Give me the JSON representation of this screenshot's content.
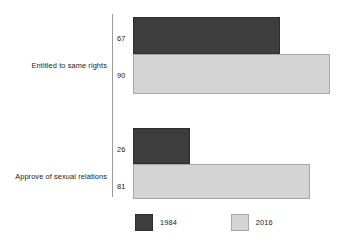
{
  "chart_data": {
    "type": "bar",
    "orientation": "horizontal",
    "title": "",
    "subtitle": "",
    "xlabel": "",
    "ylabel": "",
    "xlim": [
      0,
      100
    ],
    "grid": false,
    "legend_position": "bottom",
    "categories": [
      "Entitled to same rights",
      "Approve of sexual relations"
    ],
    "series": [
      {
        "name": "1984",
        "color": "#3d3d3d",
        "values": [
          67,
          26
        ]
      },
      {
        "name": "2016",
        "color": "#d4d4d4",
        "values": [
          90,
          81
        ]
      }
    ],
    "data_labels": {
      "group_0": {
        "series_0": "67",
        "series_1": "90"
      },
      "group_1": {
        "series_0": "26",
        "series_1": "81"
      }
    }
  },
  "legend": {
    "items": [
      {
        "label": "1984"
      },
      {
        "label": "2016"
      }
    ]
  }
}
